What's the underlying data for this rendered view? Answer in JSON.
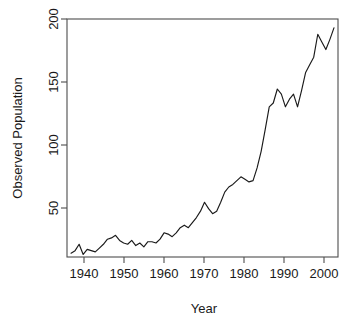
{
  "chart_data": {
    "type": "line",
    "title": "",
    "xlabel": "Year",
    "ylabel": "Observed Population",
    "xlim": [
      1937,
      2004
    ],
    "ylim": [
      15,
      202
    ],
    "grid": false,
    "legend": "none",
    "x_ticks": [
      1940,
      1950,
      1960,
      1970,
      1980,
      1990,
      2000
    ],
    "y_ticks": [
      50,
      100,
      150,
      200
    ],
    "series": [
      {
        "name": "Observed Population",
        "color": "#1a1a1a",
        "x": [
          1938,
          1939,
          1940,
          1941,
          1942,
          1943,
          1944,
          1945,
          1946,
          1947,
          1948,
          1949,
          1950,
          1951,
          1952,
          1953,
          1954,
          1955,
          1956,
          1957,
          1958,
          1959,
          1960,
          1961,
          1962,
          1963,
          1964,
          1965,
          1966,
          1967,
          1968,
          1969,
          1970,
          1971,
          1972,
          1973,
          1974,
          1975,
          1976,
          1977,
          1978,
          1979,
          1980,
          1981,
          1982,
          1983,
          1984,
          1985,
          1986,
          1987,
          1988,
          1989,
          1990,
          1991,
          1992,
          1993,
          1994,
          1995,
          1996,
          1997,
          1998,
          1999,
          2000,
          2001,
          2002,
          2003
        ],
        "values": [
          18,
          20,
          25,
          17,
          21,
          20,
          19,
          22,
          25,
          29,
          30,
          32,
          28,
          26,
          25,
          28,
          24,
          26,
          23,
          27,
          27,
          26,
          29,
          34,
          33,
          31,
          34,
          38,
          40,
          38,
          42,
          46,
          51,
          58,
          53,
          49,
          51,
          58,
          66,
          70,
          72,
          75,
          78,
          76,
          74,
          75,
          85,
          98,
          115,
          133,
          136,
          147,
          143,
          133,
          139,
          143,
          133,
          146,
          160,
          166,
          172,
          190,
          184,
          178,
          186,
          195
        ]
      }
    ]
  }
}
